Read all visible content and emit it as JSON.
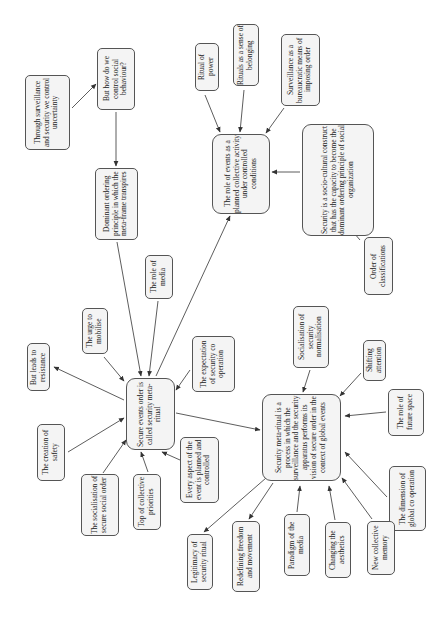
{
  "diagram": {
    "type": "concept-map",
    "orientation": "rotated-90-ccw",
    "colors": {
      "node_fill": "#f4f4f4",
      "node_border": "#555555",
      "edge": "#333333",
      "text": "#222222"
    },
    "nodes": [
      {
        "id": "uncertainty",
        "label": "Through surveillance and security we control uncertainty",
        "x": 25,
        "y": 75,
        "w": 45,
        "h": 75
      },
      {
        "id": "control_behaviour",
        "label": "But how do we control social behaviour?",
        "x": 97,
        "y": 48,
        "w": 38,
        "h": 62
      },
      {
        "id": "dominant_principle",
        "label": "Dominant ordering principle in which the meta-frame transpires",
        "x": 95,
        "y": 168,
        "w": 43,
        "h": 72
      },
      {
        "id": "role_media",
        "label": "The role of media",
        "x": 145,
        "y": 255,
        "w": 28,
        "h": 44
      },
      {
        "id": "urge_mobilise",
        "label": "The urge to mobilise",
        "x": 82,
        "y": 308,
        "w": 26,
        "h": 46
      },
      {
        "id": "resistance",
        "label": "But leads to resistance",
        "x": 27,
        "y": 343,
        "w": 23,
        "h": 48
      },
      {
        "id": "creation_safety",
        "label": "The creation of safety",
        "x": 37,
        "y": 424,
        "w": 28,
        "h": 57
      },
      {
        "id": "socialisation_order",
        "label": "The socialisation of secure social order",
        "x": 81,
        "y": 474,
        "w": 38,
        "h": 62
      },
      {
        "id": "secure_events",
        "label": "Secure events order is called security meta-ritual",
        "x": 126,
        "y": 378,
        "w": 49,
        "h": 72,
        "big": true
      },
      {
        "id": "top_priorities",
        "label": "Top of collective priorities",
        "x": 133,
        "y": 474,
        "w": 28,
        "h": 56
      },
      {
        "id": "every_aspect",
        "label": "Every aspect of the event is planned and controlled",
        "x": 180,
        "y": 437,
        "w": 39,
        "h": 66
      },
      {
        "id": "expectation",
        "label": "The expectation of security co operation",
        "x": 192,
        "y": 336,
        "w": 43,
        "h": 56
      },
      {
        "id": "role_events",
        "label": "The role of events as a planned collective activity under controlled conditions",
        "x": 212,
        "y": 134,
        "w": 58,
        "h": 80,
        "big": true
      },
      {
        "id": "ritual_power",
        "label": "Ritual of power",
        "x": 195,
        "y": 43,
        "w": 24,
        "h": 48
      },
      {
        "id": "rituals_belonging",
        "label": "Rituals as a sense of belonging",
        "x": 233,
        "y": 24,
        "w": 26,
        "h": 62
      },
      {
        "id": "surveillance_bureaucratic",
        "label": "Surveillance as a bureaucratic means of imposing order",
        "x": 281,
        "y": 34,
        "w": 39,
        "h": 72
      },
      {
        "id": "socio_cultural",
        "label": "Security is a socio-cultural construct that has the capacity to become the dominant ordering principle of social organization",
        "x": 302,
        "y": 124,
        "w": 72,
        "h": 112,
        "big": true
      },
      {
        "id": "order_classifications",
        "label": "Order of classifications",
        "x": 364,
        "y": 237,
        "w": 29,
        "h": 58
      },
      {
        "id": "socialisation_normalisation",
        "label": "Socialisation of security normalisation",
        "x": 293,
        "y": 306,
        "w": 36,
        "h": 62
      },
      {
        "id": "shifting_attention",
        "label": "Shifting attention",
        "x": 363,
        "y": 340,
        "w": 23,
        "h": 41
      },
      {
        "id": "future_space",
        "label": "The role of future space",
        "x": 388,
        "y": 389,
        "w": 36,
        "h": 47
      },
      {
        "id": "global_cooperation",
        "label": "The dimension of global co operation",
        "x": 389,
        "y": 466,
        "w": 37,
        "h": 65
      },
      {
        "id": "meta_ritual",
        "label": "Security meta-ritual is a process in which the surveillance and the security apparatus performs its vision of secure order in the context of global events",
        "x": 262,
        "y": 394,
        "w": 79,
        "h": 87,
        "big": true
      },
      {
        "id": "collective_memory",
        "label": "New collective memory",
        "x": 367,
        "y": 521,
        "w": 28,
        "h": 54
      },
      {
        "id": "aesthetics",
        "label": "Changing the aesthetics",
        "x": 325,
        "y": 522,
        "w": 26,
        "h": 56
      },
      {
        "id": "paradigm_media",
        "label": "Paradigm of the media",
        "x": 284,
        "y": 514,
        "w": 26,
        "h": 62
      },
      {
        "id": "redefining_freedom",
        "label": "Redefining freedom and movement",
        "x": 232,
        "y": 521,
        "w": 28,
        "h": 71
      },
      {
        "id": "legitimacy",
        "label": "Legitimacy of security ritual",
        "x": 187,
        "y": 534,
        "w": 26,
        "h": 56
      }
    ],
    "edges": [
      {
        "from": "uncertainty",
        "to": "control_behaviour",
        "x1": 72,
        "y1": 108,
        "x2": 96,
        "y2": 84
      },
      {
        "from": "control_behaviour",
        "to": "dominant_principle",
        "x1": 116,
        "y1": 112,
        "x2": 116,
        "y2": 166
      },
      {
        "from": "dominant_principle",
        "to": "secure_events",
        "x1": 117,
        "y1": 242,
        "x2": 141,
        "y2": 376
      },
      {
        "from": "role_media",
        "to": "secure_events",
        "x1": 158,
        "y1": 301,
        "x2": 149,
        "y2": 376
      },
      {
        "from": "secure_events",
        "to": "role_events",
        "x1": 156,
        "y1": 376,
        "x2": 230,
        "y2": 216
      },
      {
        "from": "urge_mobilise",
        "to": "secure_events",
        "x1": 104,
        "y1": 357,
        "x2": 124,
        "y2": 381
      },
      {
        "from": "secure_events",
        "to": "resistance",
        "x1": 124,
        "y1": 400,
        "x2": 54,
        "y2": 367
      },
      {
        "from": "creation_safety",
        "to": "secure_events",
        "x1": 68,
        "y1": 452,
        "x2": 124,
        "y2": 418
      },
      {
        "from": "socialisation_order",
        "to": "secure_events",
        "x1": 103,
        "y1": 473,
        "x2": 126,
        "y2": 440
      },
      {
        "from": "top_priorities",
        "to": "secure_events",
        "x1": 148,
        "y1": 472,
        "x2": 141,
        "y2": 452
      },
      {
        "from": "every_aspect",
        "to": "secure_events",
        "x1": 180,
        "y1": 460,
        "x2": 162,
        "y2": 452
      },
      {
        "from": "expectation",
        "to": "secure_events",
        "x1": 190,
        "y1": 370,
        "x2": 176,
        "y2": 390
      },
      {
        "from": "secure_events",
        "to": "meta_ritual",
        "x1": 176,
        "y1": 413,
        "x2": 260,
        "y2": 430
      },
      {
        "from": "ritual_power",
        "to": "role_events",
        "x1": 205,
        "y1": 95,
        "x2": 220,
        "y2": 132
      },
      {
        "from": "rituals_belonging",
        "to": "role_events",
        "x1": 244,
        "y1": 90,
        "x2": 240,
        "y2": 132
      },
      {
        "from": "surveillance_bureaucratic",
        "to": "role_events",
        "x1": 284,
        "y1": 108,
        "x2": 266,
        "y2": 133
      },
      {
        "from": "socio_cultural",
        "to": "role_events",
        "x1": 300,
        "y1": 172,
        "x2": 272,
        "y2": 172
      },
      {
        "from": "order_classifications",
        "to": "socio_cultural",
        "x1": 360,
        "y1": 240,
        "x2": 342,
        "y2": 219
      },
      {
        "from": "socialisation_normalisation",
        "to": "meta_ritual",
        "x1": 310,
        "y1": 370,
        "x2": 303,
        "y2": 392
      },
      {
        "from": "shifting_attention",
        "to": "meta_ritual",
        "x1": 361,
        "y1": 373,
        "x2": 340,
        "y2": 396
      },
      {
        "from": "future_space",
        "to": "meta_ritual",
        "x1": 386,
        "y1": 412,
        "x2": 345,
        "y2": 416
      },
      {
        "from": "global_cooperation",
        "to": "meta_ritual",
        "x1": 387,
        "y1": 497,
        "x2": 345,
        "y2": 452
      },
      {
        "from": "collective_memory",
        "to": "meta_ritual",
        "x1": 372,
        "y1": 519,
        "x2": 342,
        "y2": 478
      },
      {
        "from": "aesthetics",
        "to": "meta_ritual",
        "x1": 335,
        "y1": 520,
        "x2": 329,
        "y2": 486
      },
      {
        "from": "paradigm_media",
        "to": "meta_ritual",
        "x1": 297,
        "y1": 512,
        "x2": 300,
        "y2": 486
      },
      {
        "from": "meta_ritual",
        "to": "redefining_freedom",
        "x1": 273,
        "y1": 483,
        "x2": 249,
        "y2": 519
      },
      {
        "from": "meta_ritual",
        "to": "legitimacy",
        "x1": 266,
        "y1": 478,
        "x2": 204,
        "y2": 532
      }
    ]
  }
}
